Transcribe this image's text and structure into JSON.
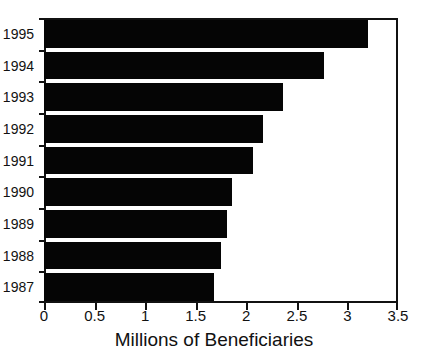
{
  "chart_data": {
    "type": "bar",
    "orientation": "horizontal",
    "title": "",
    "xlabel": "Millions of Beneficiaries",
    "ylabel": "",
    "categories": [
      "1995",
      "1994",
      "1993",
      "1992",
      "1991",
      "1990",
      "1989",
      "1988",
      "1987"
    ],
    "values": [
      3.2,
      2.77,
      2.36,
      2.17,
      2.07,
      1.86,
      1.81,
      1.75,
      1.68
    ],
    "xlim": [
      0,
      3.5
    ],
    "xticks": [
      "0",
      "0.5",
      "1",
      "1.5",
      "2",
      "2.5",
      "3",
      "3.5"
    ],
    "xtick_values": [
      0,
      0.5,
      1,
      1.5,
      2,
      2.5,
      3,
      3.5
    ],
    "grid": false,
    "legend": false,
    "bar_color": "#050505",
    "axis_color": "#111111",
    "background_color": "#ffffff"
  }
}
